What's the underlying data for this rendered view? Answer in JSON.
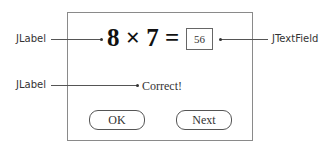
{
  "diagram": {
    "equation": "8 × 7 =",
    "answer_field": {
      "value": "56"
    },
    "result_label": "Correct!",
    "buttons": {
      "ok": "OK",
      "next": "Next"
    },
    "callouts": {
      "equation_label": "JLabel",
      "result_label": "JLabel",
      "text_field": "JTextField"
    }
  }
}
